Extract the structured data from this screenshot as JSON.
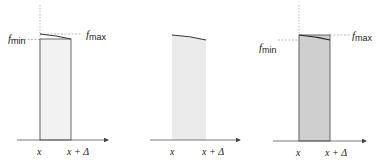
{
  "panels": [
    {
      "id": "lower-sum",
      "labels": {
        "fmax": "f",
        "fmax_sub": "max",
        "fmin": "f",
        "fmin_sub": "min",
        "x": "x",
        "xd": "x + Δ"
      },
      "fill": "#f2f2f2"
    },
    {
      "id": "exact-area",
      "labels": {
        "x": "x",
        "xd": "x + Δ"
      },
      "fill": "#ebebeb"
    },
    {
      "id": "upper-sum",
      "labels": {
        "fmax": "f",
        "fmax_sub": "max",
        "fmin": "f",
        "fmin_sub": "min",
        "x": "x",
        "xd": "x + Δ"
      },
      "fill": "#cfcfcf"
    }
  ],
  "colors": {
    "line": "#333333",
    "dash": "#888888",
    "axis": "#555555"
  }
}
